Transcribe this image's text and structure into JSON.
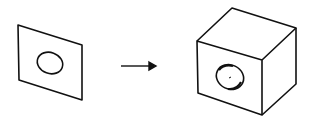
{
  "diagram": {
    "elements": [
      {
        "id": "panel",
        "label": "flat panel with hole"
      },
      {
        "id": "arrow",
        "label": "transformation arrow"
      },
      {
        "id": "cube",
        "label": "cube with hole"
      }
    ],
    "colors": {
      "stroke": "#111111",
      "background": "#ffffff"
    }
  }
}
